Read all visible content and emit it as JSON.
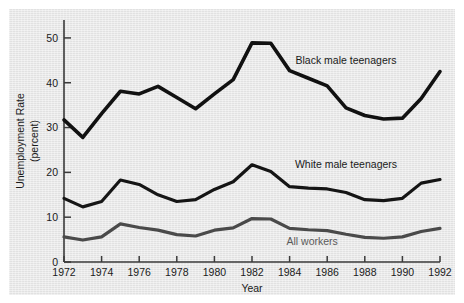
{
  "chart_data": {
    "type": "line",
    "title": "",
    "subtitle": "",
    "xlabel": "Year",
    "ylabel": "Unemployment Rate (percent)",
    "ylabel_line1": "Unemployment Rate",
    "ylabel_line2": "(percent)",
    "xlim": [
      1972,
      1992
    ],
    "ylim": [
      0,
      54
    ],
    "grid": false,
    "legend_position": "inline-annotations",
    "x": [
      1972,
      1973,
      1974,
      1975,
      1976,
      1977,
      1978,
      1979,
      1980,
      1981,
      1982,
      1983,
      1984,
      1985,
      1986,
      1987,
      1988,
      1989,
      1990,
      1991,
      1992
    ],
    "xticks": [
      1972,
      1974,
      1976,
      1978,
      1980,
      1982,
      1984,
      1986,
      1988,
      1990,
      1992
    ],
    "xtick_labels": [
      "1972",
      "1974",
      "1976",
      "1978",
      "1980",
      "1982",
      "1984",
      "1986",
      "1988",
      "1990",
      "1992"
    ],
    "yticks": [
      0,
      10,
      20,
      30,
      40,
      50
    ],
    "ytick_labels": [
      "0",
      "10",
      "20",
      "30",
      "40",
      "50"
    ],
    "series": [
      {
        "name": "Black male teenagers",
        "color": "#111111",
        "width": 3.6,
        "label_x": 1987.0,
        "label_y": 44.2,
        "values": [
          31.7,
          27.8,
          33.1,
          38.1,
          37.5,
          39.2,
          36.7,
          34.2,
          37.5,
          40.7,
          48.9,
          48.8,
          42.7,
          41.0,
          39.3,
          34.4,
          32.7,
          31.9,
          32.1,
          36.5,
          42.5
        ]
      },
      {
        "name": "White male teenagers",
        "color": "#151515",
        "width": 3.2,
        "label_x": 1987.0,
        "label_y": 21.0,
        "values": [
          14.2,
          12.3,
          13.5,
          18.3,
          17.3,
          15.0,
          13.5,
          13.9,
          16.2,
          17.9,
          21.7,
          20.2,
          16.8,
          16.5,
          16.3,
          15.5,
          13.9,
          13.7,
          14.2,
          17.6,
          18.4
        ]
      },
      {
        "name": "All workers",
        "color": "#4a4a4a",
        "width": 3.2,
        "label_x": 1985.2,
        "label_y": 3.9,
        "values": [
          5.6,
          4.9,
          5.6,
          8.5,
          7.7,
          7.1,
          6.1,
          5.8,
          7.1,
          7.6,
          9.7,
          9.6,
          7.5,
          7.2,
          7.0,
          6.2,
          5.5,
          5.3,
          5.6,
          6.8,
          7.5
        ]
      }
    ]
  },
  "axis": {
    "x_axis_title": "Year",
    "y_axis_title_line1": "Unemployment Rate",
    "y_axis_title_line2": "(percent)"
  }
}
